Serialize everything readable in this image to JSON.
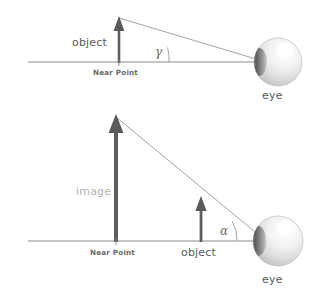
{
  "figure": {
    "colors": {
      "baseline": "#8c8c8c",
      "ray": "#9a9a9a",
      "arrow": "#5a5a5a",
      "label": "#5a5a5a",
      "label_small": "#6b6b6b",
      "label_faint": "#b4b4b4",
      "angle_arc": "#9a9a9a",
      "eye_outline": "#b0b0b0",
      "eye_highlight": "#ffffff",
      "eye_shade": "#c8c8c8",
      "cornea": "#6e6e6e",
      "background": "#ffffff"
    },
    "panels": [
      {
        "id": "top",
        "name": "unaided-eye-panel",
        "labels": {
          "object": "object",
          "near_point": "Near Point",
          "eye": "eye",
          "angle": "γ"
        },
        "geometry": {
          "baseline_y": 62,
          "baseline_x1": 28,
          "baseline_x2": 262,
          "object_x": 119,
          "object_tip_y": 17,
          "eye_center_x": 278,
          "eye_center_y": 62,
          "eye_radius": 24
        }
      },
      {
        "id": "bottom",
        "name": "magnifier-panel",
        "labels": {
          "image": "image",
          "object": "object",
          "near_point": "Near Point",
          "eye": "eye",
          "angle": "α"
        },
        "geometry": {
          "baseline_y": 241,
          "baseline_x1": 28,
          "baseline_x2": 262,
          "image_x": 116,
          "image_tip_y": 116,
          "object_x": 201,
          "object_tip_y": 198,
          "eye_center_x": 278,
          "eye_center_y": 241,
          "eye_radius": 25
        }
      }
    ]
  }
}
